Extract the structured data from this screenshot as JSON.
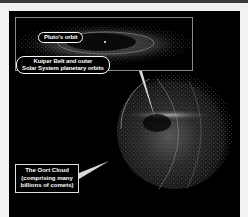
{
  "diagram": {
    "labels": {
      "plutos_orbit": "Pluto's orbit",
      "kuiper_belt_line1": "Kuiper Belt and outer",
      "kuiper_belt_line2": "Solar System planetary orbits",
      "oort_line1": "The Oort Cloud",
      "oort_line2": "(comprising many",
      "oort_line3": "billions of comets)"
    },
    "colors": {
      "background": "#000000",
      "page_margin": "#f2f2f2",
      "label_text": "#ffffff",
      "inset_border": "#8a8a8a",
      "pointer": "#d8d8d8"
    }
  }
}
